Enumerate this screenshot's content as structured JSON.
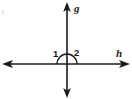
{
  "figure": {
    "background_color": "#ffffff",
    "stroke_color": "#1a1a1a",
    "width": 132,
    "height": 99,
    "intersection": {
      "x": 67,
      "y": 64
    },
    "lines": [
      {
        "name": "g",
        "label": "g",
        "orientation": "vertical",
        "double_headed": true,
        "from": {
          "x": 67,
          "y": 5
        },
        "to": {
          "x": 67,
          "y": 96
        }
      },
      {
        "name": "h",
        "label": "h",
        "orientation": "horizontal",
        "double_headed": true,
        "from": {
          "x": 5,
          "y": 64
        },
        "to": {
          "x": 127,
          "y": 64
        }
      }
    ],
    "angles": [
      {
        "label": "1",
        "position": "upper-left",
        "x": 53,
        "y": 49
      },
      {
        "label": "2",
        "position": "upper-right",
        "x": 74,
        "y": 48
      }
    ],
    "arc": {
      "name": "straight-angle-arc",
      "center": {
        "x": 67,
        "y": 64
      },
      "radius": 10,
      "sweep": "semicircle-above-horizontal"
    }
  }
}
